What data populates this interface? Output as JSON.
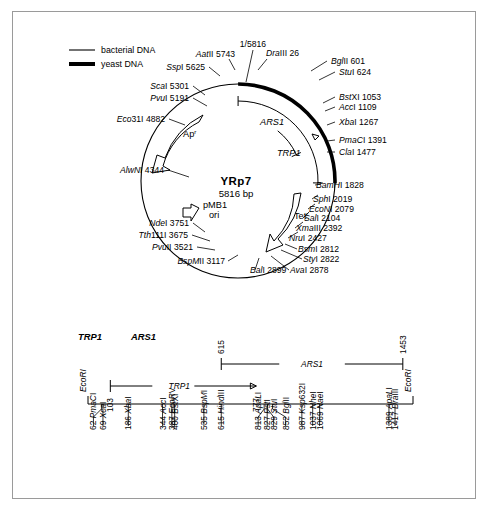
{
  "figure": {
    "legend": [
      {
        "id": "bacterial",
        "label": "bacterial DNA",
        "style": "thin-line",
        "color": "#000000"
      },
      {
        "id": "yeast",
        "label": "yeast DNA",
        "style": "thick-line",
        "color": "#000000"
      }
    ],
    "plasmid": {
      "name": "YRp7",
      "size": "5816 bp",
      "origin_label": "1/5816",
      "features": [
        {
          "name": "Ap",
          "superscript": "r",
          "display": "Apr"
        },
        {
          "name": "pMB1",
          "sublabel": "ori",
          "display": "pMB1 ori"
        },
        {
          "name": "Tet",
          "superscript": "r",
          "display": "Tetr"
        },
        {
          "name": "ARS1",
          "display": "ARS1"
        },
        {
          "name": "TRP1",
          "display": "TRP1"
        }
      ],
      "sites": [
        {
          "label": "AatII 5743",
          "enzyme": "AatII",
          "pos": 5743
        },
        {
          "label": "SspI 5625",
          "enzyme": "SspI",
          "pos": 5625
        },
        {
          "label": "ScaI 5301",
          "enzyme": "ScaI",
          "pos": 5301
        },
        {
          "label": "PvuI 5191",
          "enzyme": "PvuI",
          "pos": 5191
        },
        {
          "label": "Eco31I 4882",
          "enzyme": "Eco31I",
          "pos": 4882
        },
        {
          "label": "AlwNI 4344",
          "enzyme": "AlwNI",
          "pos": 4344
        },
        {
          "label": "NdeI 3751",
          "enzyme": "NdeI",
          "pos": 3751
        },
        {
          "label": "Tth111I 3675",
          "enzyme": "Tth111I",
          "pos": 3675
        },
        {
          "label": "PvuII 3521",
          "enzyme": "PvuII",
          "pos": 3521
        },
        {
          "label": "BspMII 3117",
          "enzyme": "BspMII",
          "pos": 3117
        },
        {
          "label": "BalI 2899",
          "enzyme": "BalI",
          "pos": 2899
        },
        {
          "label": "AvaI 2878",
          "enzyme": "AvaI",
          "pos": 2878
        },
        {
          "label": "StyI 2822",
          "enzyme": "StyI",
          "pos": 2822
        },
        {
          "label": "BsmI 2812",
          "enzyme": "BsmI",
          "pos": 2812
        },
        {
          "label": "NruI 2427",
          "enzyme": "NruI",
          "pos": 2427
        },
        {
          "label": "XmaIII 2392",
          "enzyme": "XmaIII",
          "pos": 2392
        },
        {
          "label": "SalI 2104",
          "enzyme": "SalI",
          "pos": 2104
        },
        {
          "label": "EcoNI 2079",
          "enzyme": "EcoNI",
          "pos": 2079
        },
        {
          "label": "SphI 2019",
          "enzyme": "SphI",
          "pos": 2019
        },
        {
          "label": "BamHI 1828",
          "enzyme": "BamHI",
          "pos": 1828
        },
        {
          "label": "ClaI 1477",
          "enzyme": "ClaI",
          "pos": 1477
        },
        {
          "label": "PmaCI 1391",
          "enzyme": "PmaCI",
          "pos": 1391
        },
        {
          "label": "XbaI 1267",
          "enzyme": "XbaI",
          "pos": 1267
        },
        {
          "label": "AccI 1109",
          "enzyme": "AccI",
          "pos": 1109
        },
        {
          "label": "BstXI 1053",
          "enzyme": "BstXI",
          "pos": 1053
        },
        {
          "label": "StuI 624",
          "enzyme": "StuI",
          "pos": 624
        },
        {
          "label": "BglII 601",
          "enzyme": "BglII",
          "pos": 601
        },
        {
          "label": "DraIII 26",
          "enzyme": "DraIII",
          "pos": 26
        }
      ]
    },
    "linear_map": {
      "headers": [
        "TRP1",
        "ARS1"
      ],
      "left_end_label": "EcoRI",
      "right_end_label": "EcoRI",
      "trp1_span": {
        "label": "TRP1",
        "start": "103",
        "end": "777"
      },
      "ars1_span": {
        "label": "ARS1",
        "start": "615",
        "end": "1453"
      },
      "sites": [
        {
          "pos": 62,
          "enzyme": "PmaCI",
          "label": "62 PmaCI"
        },
        {
          "pos": 69,
          "enzyme": "XcaI",
          "label": "69 XcaI"
        },
        {
          "pos": 186,
          "enzyme": "XbaI",
          "label": "186 XbaI"
        },
        {
          "pos": 344,
          "enzyme": "AccI",
          "label": "344 AccI"
        },
        {
          "pos": 387,
          "enzyme": "EcoRV",
          "label": "387 EcoRV"
        },
        {
          "pos": 400,
          "enzyme": "BstXI",
          "label": "400 BstXI"
        },
        {
          "pos": 535,
          "enzyme": "BspMI",
          "label": "535 BspMI"
        },
        {
          "pos": 615,
          "enzyme": "HindIII",
          "label": "615 HindIII"
        },
        {
          "pos": 813,
          "enzyme": "ApaLI",
          "label": "813 ApaLI"
        },
        {
          "pos": 827,
          "enzyme": "PstI",
          "label": "827 PstI"
        },
        {
          "pos": 829,
          "enzyme": "StuI",
          "label": "829 StuI"
        },
        {
          "pos": 852,
          "enzyme": "BglII",
          "label": "852 BglII"
        },
        {
          "pos": 987,
          "enzyme": "Ksp632I",
          "label": "987 Ksp632I"
        },
        {
          "pos": 1037,
          "enzyme": "NheI",
          "label": "1037 NheI"
        },
        {
          "pos": 1069,
          "enzyme": "NaeI",
          "label": "1069 NaeI"
        },
        {
          "pos": 1389,
          "enzyme": "ApaLI",
          "label": "1389 ApaLI"
        },
        {
          "pos": 1417,
          "enzyme": "DraIII",
          "label": "1417 DraIII"
        }
      ]
    }
  }
}
